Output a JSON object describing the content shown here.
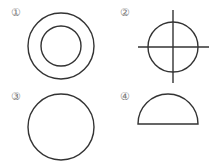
{
  "labels": {
    "fig1": "①",
    "fig2": "②",
    "fig3": "③",
    "fig4": "④"
  },
  "figures": [
    {
      "id": 1,
      "description": "two concentric circles"
    },
    {
      "id": 2,
      "description": "circle with crosshair lines through center"
    },
    {
      "id": 3,
      "description": "single circle"
    },
    {
      "id": 4,
      "description": "semicircle with flat base"
    }
  ],
  "colors": {
    "stroke": "#333333",
    "label": "#777777",
    "background": "#ffffff"
  }
}
